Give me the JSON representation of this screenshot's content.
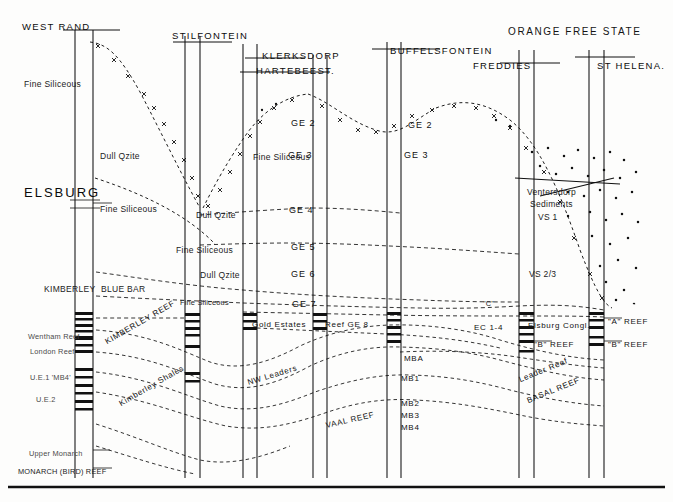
{
  "figure": {
    "kind": "geological-cross-section",
    "ink_color": "#111111",
    "background": "#fdfdfc"
  },
  "headers": [
    {
      "id": "west-rand",
      "text": "WEST RAND",
      "x": 22,
      "y": 22,
      "cls": "hdr"
    },
    {
      "id": "stilfontein",
      "text": "STILFONTEIN",
      "x": 172,
      "y": 31,
      "cls": "hdr"
    },
    {
      "id": "klerksdorp",
      "text": "KLERKSDORP",
      "x": 262,
      "y": 51,
      "cls": "hdr"
    },
    {
      "id": "hartebeest",
      "text": "HARTEBEEST.",
      "x": 256,
      "y": 66,
      "cls": "hdr"
    },
    {
      "id": "buffelsfontein",
      "text": "BUFFELSFONTEIN",
      "x": 390,
      "y": 46,
      "cls": "hdr"
    },
    {
      "id": "orange-free-state",
      "text": "ORANGE FREE STATE",
      "x": 508,
      "y": 27,
      "cls": "hdr-big"
    },
    {
      "id": "freddies",
      "text": "FREDDIES",
      "x": 473,
      "y": 61,
      "cls": "hdr"
    },
    {
      "id": "st-helena",
      "text": "ST HELENA.",
      "x": 597,
      "y": 61,
      "cls": "hdr"
    }
  ],
  "group_label": {
    "text": "ELSBURG",
    "x": 24,
    "y": 186
  },
  "unit_labels": [
    {
      "id": "fine-siliceous-1",
      "text": "Fine Siliceous",
      "x": 24,
      "y": 80,
      "cls": "unit"
    },
    {
      "id": "dull-qzite-1",
      "text": "Dull Qzite",
      "x": 100,
      "y": 152,
      "cls": "unit"
    },
    {
      "id": "fine-siliceous-2",
      "text": "Fine Siliceous",
      "x": 100,
      "y": 205,
      "cls": "unit"
    },
    {
      "id": "dull-qzite-2",
      "text": "Dull Qzite",
      "x": 196,
      "y": 211,
      "cls": "unit"
    },
    {
      "id": "fine-siliceous-3",
      "text": "Fine Siliceous",
      "x": 253,
      "y": 153,
      "cls": "unit"
    },
    {
      "id": "fine-siliceous-4",
      "text": "Fine Siliceous",
      "x": 176,
      "y": 246,
      "cls": "unit"
    },
    {
      "id": "dull-qzite-3",
      "text": "Dull Qzite",
      "x": 200,
      "y": 271,
      "cls": "unit"
    },
    {
      "id": "fine-siliceous-5",
      "text": "Fine Siliceous",
      "x": 180,
      "y": 299,
      "cls": "unit-sm"
    },
    {
      "id": "kimberley",
      "text": "KIMBERLEY",
      "x": 44,
      "y": 285,
      "cls": "unit"
    },
    {
      "id": "blue-bar",
      "text": "BLUE BAR",
      "x": 101,
      "y": 285,
      "cls": "unit"
    }
  ],
  "ge_labels": [
    {
      "id": "ge2-a",
      "text": "GE 2",
      "x": 291,
      "y": 119
    },
    {
      "id": "ge3-a",
      "text": "GE 3",
      "x": 288,
      "y": 151
    },
    {
      "id": "ge4",
      "text": "GE 4",
      "x": 289,
      "y": 206
    },
    {
      "id": "ge5",
      "text": "GE 5",
      "x": 291,
      "y": 243
    },
    {
      "id": "ge6",
      "text": "GE 6",
      "x": 291,
      "y": 270
    },
    {
      "id": "ge7",
      "text": "GE 7",
      "x": 292,
      "y": 300
    },
    {
      "id": "ge2-b",
      "text": "GE 2",
      "x": 408,
      "y": 121
    },
    {
      "id": "ge3-b",
      "text": "GE 3",
      "x": 404,
      "y": 151
    }
  ],
  "ventersdorp": [
    {
      "id": "ventersdorp",
      "text": "Ventersdorp",
      "x": 527,
      "y": 188
    },
    {
      "id": "sediments",
      "text": "Sediments",
      "x": 530,
      "y": 200
    },
    {
      "id": "vs1",
      "text": "VS 1",
      "x": 538,
      "y": 213
    },
    {
      "id": "vs23",
      "text": "VS 2/3",
      "x": 529,
      "y": 270
    }
  ],
  "reef_labels": [
    {
      "id": "gold-estates-reef",
      "text": "Gold Estates",
      "x": 252,
      "y": 321,
      "cls": "reefcap"
    },
    {
      "id": "reef-ge8",
      "text": "Reef  GE 8",
      "x": 325,
      "y": 321,
      "cls": "reefcap"
    },
    {
      "id": "nw-leaders",
      "text": "NW Leaders",
      "x": 249,
      "y": 379,
      "cls": "reefcap rot-c"
    },
    {
      "id": "vaal-reef",
      "text": "VAAL REEF",
      "x": 327,
      "y": 422,
      "cls": "reefcap rot-f"
    },
    {
      "id": "mba",
      "text": "MBA",
      "x": 404,
      "y": 355,
      "cls": "reefcap"
    },
    {
      "id": "mb1",
      "text": "MB1",
      "x": 401,
      "y": 375,
      "cls": "reefcap"
    },
    {
      "id": "mb2",
      "text": "MB2",
      "x": 401,
      "y": 400,
      "cls": "reefcap"
    },
    {
      "id": "mb3",
      "text": "MB3",
      "x": 401,
      "y": 412,
      "cls": "reefcap"
    },
    {
      "id": "mb4",
      "text": "MB4",
      "x": 401,
      "y": 424,
      "cls": "reefcap"
    },
    {
      "id": "ec-1-4",
      "text": "EC 1-4",
      "x": 474,
      "y": 324,
      "cls": "reefcap"
    },
    {
      "id": "elsburg-congl",
      "text": "Elsburg Congl.",
      "x": 528,
      "y": 322,
      "cls": "reefcap"
    },
    {
      "id": "a-reef-r",
      "text": "\"A\" REEF",
      "x": 608,
      "y": 318,
      "cls": "reefcap"
    },
    {
      "id": "b-reef-mid",
      "text": "\"B\" REEF",
      "x": 534,
      "y": 341,
      "cls": "reefcap"
    },
    {
      "id": "b-reef-r",
      "text": "\"B\" REEF",
      "x": 608,
      "y": 341,
      "cls": "reefcap"
    },
    {
      "id": "leader-reef",
      "text": "Leader Reef",
      "x": 521,
      "y": 376,
      "cls": "reefcap rot-e"
    },
    {
      "id": "basal-reef",
      "text": "BASAL REEF",
      "x": 529,
      "y": 397,
      "cls": "reefcap rot-e"
    },
    {
      "id": "vs-c",
      "text": "\"C\"",
      "x": 483,
      "y": 300,
      "cls": "unit-sm"
    },
    {
      "id": "kimberley-reef",
      "text": "KIMBERLEY REEF",
      "x": 108,
      "y": 338,
      "cls": "reefcap rot-b"
    },
    {
      "id": "kimberley-shales",
      "text": "Kimberley Shales",
      "x": 122,
      "y": 400,
      "cls": "reefcap rot-b"
    }
  ],
  "left_reef_labels": [
    {
      "id": "wentham-reef",
      "text": "Wentham Reef",
      "x": 28,
      "y": 333,
      "cls": "unit-sm faint"
    },
    {
      "id": "london-reef",
      "text": "London  Reef",
      "x": 30,
      "y": 348,
      "cls": "unit-sm faint"
    },
    {
      "id": "ue1-mb4",
      "text": "U.E.1 'MB4'",
      "x": 30,
      "y": 374,
      "cls": "unit-sm faint"
    },
    {
      "id": "ue2",
      "text": "U.E.2",
      "x": 36,
      "y": 396,
      "cls": "unit-sm faint"
    },
    {
      "id": "upper-monarch",
      "text": "Upper Monarch",
      "x": 29,
      "y": 450,
      "cls": "unit-sm faint"
    },
    {
      "id": "monarch-bird-reef",
      "text": "MONARCH (BIRD) REEF",
      "x": 18,
      "y": 468,
      "cls": "unit-sm"
    }
  ],
  "boreholes": [
    {
      "id": "bh-west-rand",
      "x1": 75,
      "x2": 93,
      "top": 30,
      "bottom": 478
    },
    {
      "id": "bh-stilfontein",
      "x1": 185,
      "x2": 200,
      "top": 36,
      "bottom": 478
    },
    {
      "id": "bh-klerksdorp",
      "x1": 243,
      "x2": 257,
      "top": 44,
      "bottom": 478
    },
    {
      "id": "bh-hartebeest",
      "x1": 313,
      "x2": 327,
      "top": 55,
      "bottom": 478
    },
    {
      "id": "bh-buffelsfontein",
      "x1": 387,
      "x2": 401,
      "top": 42,
      "bottom": 478
    },
    {
      "id": "bh-freddies",
      "x1": 519,
      "x2": 534,
      "top": 50,
      "bottom": 478
    },
    {
      "id": "bh-st-helena",
      "x1": 589,
      "x2": 604,
      "top": 50,
      "bottom": 478
    }
  ],
  "baseline": {
    "y": 487,
    "x1": 8,
    "x2": 665
  }
}
